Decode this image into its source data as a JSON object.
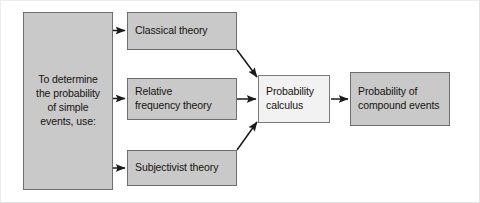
{
  "diagram": {
    "background_color": "#ffffff",
    "frame_color": "#e2e2e2",
    "box_fill": "#c9c9c9",
    "box_fill_light": "#f2f2f2",
    "box_border": "#6e6e6e",
    "arrow_color": "#1a1a1a",
    "nodes": [
      {
        "id": "source",
        "label": "To determine\nthe probability\nof simple\nevents, use:"
      },
      {
        "id": "classical",
        "label": "Classical theory"
      },
      {
        "id": "relative",
        "label": "Relative\nfrequency theory"
      },
      {
        "id": "subjectivist",
        "label": "Subjectivist theory"
      },
      {
        "id": "calculus",
        "label": "Probability\ncalculus"
      },
      {
        "id": "compound",
        "label": "Probability of\ncompound events"
      }
    ],
    "edges": [
      {
        "id": "source-to-classical",
        "from": "source",
        "to": "classical",
        "style": "straight"
      },
      {
        "id": "source-to-relative",
        "from": "source",
        "to": "relative",
        "style": "straight"
      },
      {
        "id": "source-to-subjectivist",
        "from": "source",
        "to": "subjectivist",
        "style": "straight"
      },
      {
        "id": "classical-to-calculus",
        "from": "classical",
        "to": "calculus",
        "style": "diagonal"
      },
      {
        "id": "relative-to-calculus",
        "from": "relative",
        "to": "calculus",
        "style": "straight"
      },
      {
        "id": "subjectivist-to-calculus",
        "from": "subjectivist",
        "to": "calculus",
        "style": "diagonal"
      },
      {
        "id": "calculus-to-compound",
        "from": "calculus",
        "to": "compound",
        "style": "straight"
      }
    ]
  }
}
